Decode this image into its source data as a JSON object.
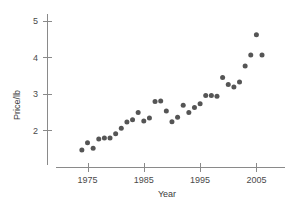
{
  "chart_data": {
    "type": "scatter",
    "title": "",
    "subtitle": "",
    "xlabel": "Year",
    "ylabel": "Price/lb",
    "xlim": [
      1972,
      2008
    ],
    "ylim": [
      1.2,
      5.2
    ],
    "xticks": [
      1975,
      1985,
      1995,
      2005
    ],
    "xtick_labels": [
      "1975",
      "1985",
      "1995",
      "2005"
    ],
    "yticks": [
      2,
      3,
      4,
      5
    ],
    "ytick_labels": [
      "2",
      "3",
      "4",
      "5"
    ],
    "grid": false,
    "legend": null,
    "marker": "filled-circle",
    "marker_color": "#555555",
    "axis_color": "#8a8a8a",
    "text_color": "#4a4a4a",
    "series": [
      {
        "name": "Price per pound",
        "x": [
          1974,
          1975,
          1976,
          1977,
          1978,
          1979,
          1980,
          1981,
          1982,
          1983,
          1984,
          1985,
          1986,
          1987,
          1988,
          1989,
          1990,
          1991,
          1992,
          1993,
          1994,
          1995,
          1996,
          1997,
          1998,
          1999,
          2000,
          2001,
          2002,
          2003,
          2004,
          2005,
          2006
        ],
        "y": [
          1.45,
          1.65,
          1.5,
          1.75,
          1.78,
          1.78,
          1.9,
          2.05,
          2.22,
          2.28,
          2.48,
          2.25,
          2.33,
          2.78,
          2.8,
          2.52,
          2.23,
          2.35,
          2.68,
          2.48,
          2.62,
          2.72,
          2.95,
          2.95,
          2.93,
          3.44,
          3.25,
          3.18,
          3.32,
          3.76,
          4.06,
          4.62,
          4.06
        ]
      }
    ]
  },
  "axis": {
    "y_label": "Price/lb",
    "x_label": "Year"
  }
}
